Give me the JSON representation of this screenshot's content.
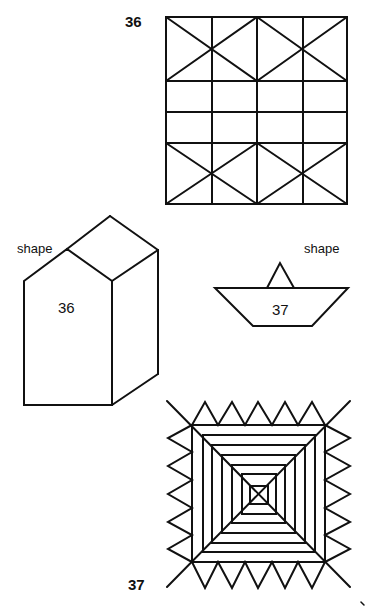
{
  "figures": {
    "grid": {
      "label": "36",
      "description": "4x4 grid with diagonal crosses forming bow-tie patterns in top and bottom bands"
    },
    "house": {
      "side_label": "shape",
      "number": "36",
      "description": "3D house-shaped prism with gabled roof"
    },
    "boat": {
      "side_label": "shape",
      "number": "37",
      "description": "Paper boat: inverted trapezoid hull with triangular sail"
    },
    "square_pattern": {
      "label": "37",
      "description": "Nested concentric squares with diagonals, sawtooth triangles on all four sides",
      "nested_square_count": 7,
      "triangles_per_side": 5
    }
  },
  "colors": {
    "stroke": "#111111",
    "background": "#ffffff"
  }
}
